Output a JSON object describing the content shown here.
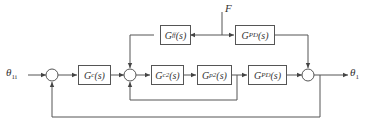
{
  "diagram": {
    "input": {
      "symbol": "θ",
      "sub": "1i"
    },
    "output": {
      "symbol": "θ",
      "sub": "1"
    },
    "disturbance": "F",
    "blocks": [
      {
        "id": "gc",
        "G": "G",
        "sub": "c",
        "arg": "(s)"
      },
      {
        "id": "gc2",
        "G": "G",
        "sub": "c2",
        "arg": "(s)"
      },
      {
        "id": "gp2",
        "G": "G",
        "sub": "p2",
        "arg": "(s)"
      },
      {
        "id": "gpd_main",
        "G": "G",
        "sub": "PD",
        "arg": "(s)"
      },
      {
        "id": "gff",
        "G": "G",
        "sub": "ff",
        "arg": "(s)"
      },
      {
        "id": "gpd_top",
        "G": "G",
        "sub": "PD",
        "arg": "(s)"
      }
    ]
  }
}
